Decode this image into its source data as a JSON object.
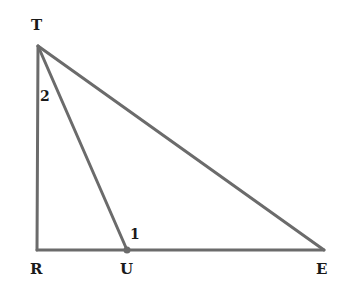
{
  "diagram": {
    "type": "geometry-triangle",
    "line_color": "#6b6b6b",
    "points": {
      "T": {
        "label": "T",
        "x": 38,
        "y": 46
      },
      "R": {
        "label": "R",
        "x": 37,
        "y": 250
      },
      "U": {
        "label": "U",
        "x": 127,
        "y": 250
      },
      "E": {
        "label": "E",
        "x": 324,
        "y": 250
      }
    },
    "segments": [
      "TR",
      "RE",
      "TE",
      "TU"
    ],
    "angle_labels": {
      "angle1": "1",
      "angle2": "2"
    }
  }
}
